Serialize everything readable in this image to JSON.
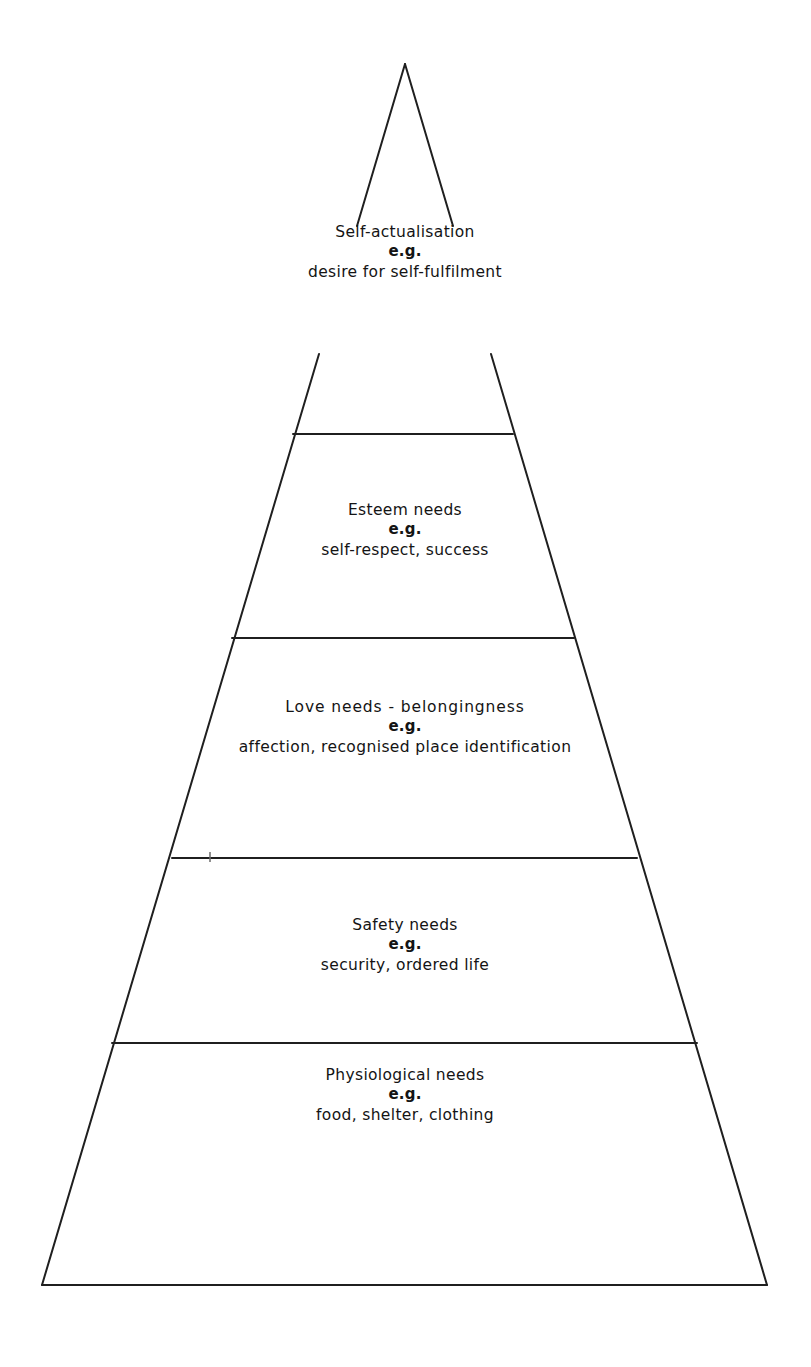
{
  "diagram": {
    "type": "pyramid",
    "name": "hierarchy-of-needs-pyramid",
    "background_color": "#ffffff",
    "line_color": "#1f1f1f",
    "line_width_px": 2,
    "apex": {
      "x": 405,
      "y": 64
    },
    "base_left": {
      "x": 42,
      "y": 1285
    },
    "base_right": {
      "x": 767,
      "y": 1285
    },
    "tiers": [
      {
        "id": "self-actualisation",
        "order": 1,
        "position": "top",
        "title": "Self-actualisation",
        "eg": "e.g.",
        "examples": "desire for self-fulfilment",
        "divider_y": 434,
        "divider_x_left": 293,
        "divider_x_right": 513
      },
      {
        "id": "esteem",
        "order": 2,
        "title": "Esteem needs",
        "eg": "e.g.",
        "examples": "self-respect, success",
        "divider_y": 638,
        "divider_x_left": 232,
        "divider_x_right": 574
      },
      {
        "id": "love",
        "order": 3,
        "title": "Love needs - belongingness",
        "eg": "e.g.",
        "examples": "affection, recognised place identification",
        "divider_y": 858,
        "divider_x_left": 172,
        "divider_x_right": 637
      },
      {
        "id": "safety",
        "order": 4,
        "title": "Safety needs",
        "eg": "e.g.",
        "examples": "security, ordered life",
        "divider_y": 1043,
        "divider_x_left": 112,
        "divider_x_right": 697
      },
      {
        "id": "physiological",
        "order": 5,
        "position": "base",
        "title": "Physiological needs",
        "eg": "e.g.",
        "examples": "food, shelter, clothing",
        "divider_y": null,
        "divider_x_left": null,
        "divider_x_right": null
      }
    ]
  }
}
